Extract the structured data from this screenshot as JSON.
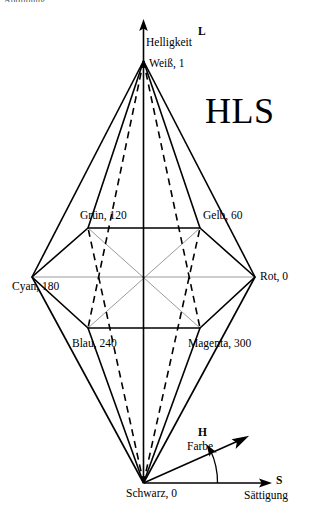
{
  "figure": {
    "title": "HLS",
    "cropped_header_text": "Abbildung",
    "axes": {
      "lightness": {
        "symbol": "L",
        "name": "Helligkeit"
      },
      "hue": {
        "symbol": "H",
        "name": "Farbe"
      },
      "saturation": {
        "symbol": "S",
        "name": "Sättigung"
      }
    },
    "apexes": {
      "top": "Weiß, 1",
      "bottom": "Schwarz, 0"
    },
    "hex_vertices": [
      {
        "label": "Rot, 0",
        "hue": 0
      },
      {
        "label": "Gelb, 60",
        "hue": 60
      },
      {
        "label": "Grün, 120",
        "hue": 120
      },
      {
        "label": "Cyan, 180",
        "hue": 180
      },
      {
        "label": "Blau, 240",
        "hue": 240
      },
      {
        "label": "Magenta, 300",
        "hue": 300
      }
    ]
  },
  "colors": {
    "stroke": "#000000",
    "inner_guide": "#9a9a9a",
    "background": "#ffffff"
  }
}
